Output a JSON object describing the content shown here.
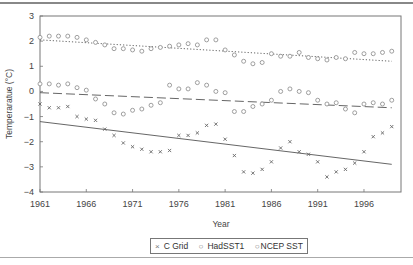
{
  "chart_data": {
    "type": "scatter",
    "title": "",
    "xlabel": "Year",
    "ylabel": "Temperaratue (°C)",
    "xlim": [
      1961,
      2000
    ],
    "ylim": [
      -4,
      3
    ],
    "x_ticks": [
      "1961",
      "1966",
      "1971",
      "1976",
      "1981",
      "1986",
      "1991",
      "1996"
    ],
    "y_ticks": [
      "3",
      "2",
      "1",
      "0",
      "−1",
      "−2",
      "−3",
      "−4"
    ],
    "grid": false,
    "legend_position": "bottom",
    "x": [
      1961,
      1962,
      1963,
      1964,
      1965,
      1966,
      1967,
      1968,
      1969,
      1970,
      1971,
      1972,
      1973,
      1974,
      1975,
      1976,
      1977,
      1978,
      1979,
      1980,
      1981,
      1982,
      1983,
      1984,
      1985,
      1986,
      1987,
      1988,
      1989,
      1990,
      1991,
      1992,
      1993,
      1994,
      1995,
      1996,
      1997,
      1998,
      1999
    ],
    "series": [
      {
        "name": "C Grid",
        "marker": "x",
        "values": [
          -0.5,
          -0.65,
          -0.65,
          -0.6,
          -1.0,
          -1.1,
          -1.15,
          -1.5,
          -1.75,
          -2.05,
          -2.2,
          -2.3,
          -2.4,
          -2.4,
          -2.35,
          -1.75,
          -1.75,
          -1.65,
          -1.35,
          -1.3,
          -1.9,
          -2.55,
          -3.2,
          -3.25,
          -3.1,
          -2.8,
          -2.25,
          -2.0,
          -2.4,
          -2.5,
          -2.8,
          -3.4,
          -3.2,
          -3.1,
          -2.85,
          -2.4,
          -1.8,
          -1.65,
          -1.4
        ],
        "trend": {
          "style": "solid",
          "start": -1.2,
          "end": -2.9
        }
      },
      {
        "name": "HadSST1",
        "marker": "o",
        "values": [
          0.3,
          0.3,
          0.25,
          0.3,
          0.15,
          0.05,
          -0.3,
          -0.5,
          -0.85,
          -0.9,
          -0.75,
          -0.7,
          -0.55,
          -0.45,
          0.25,
          0.1,
          0.1,
          0.35,
          0.25,
          0.0,
          -0.05,
          -0.8,
          -0.8,
          -0.6,
          -0.5,
          -0.35,
          0.0,
          0.1,
          0.0,
          -0.05,
          -0.35,
          -0.5,
          -0.45,
          -0.7,
          -0.85,
          -0.5,
          -0.45,
          -0.5,
          -0.35
        ],
        "trend": {
          "style": "dashed",
          "start": -0.05,
          "end": -0.65
        }
      },
      {
        "name": "NCEP SST",
        "marker": "o",
        "values": [
          2.15,
          2.2,
          2.2,
          2.2,
          2.15,
          2.05,
          1.95,
          1.85,
          1.7,
          1.7,
          1.65,
          1.6,
          1.7,
          1.75,
          1.8,
          1.85,
          1.9,
          1.85,
          2.05,
          2.05,
          1.65,
          1.45,
          1.2,
          1.1,
          1.15,
          1.5,
          1.4,
          1.4,
          1.55,
          1.35,
          1.3,
          1.25,
          1.35,
          1.3,
          1.55,
          1.5,
          1.5,
          1.55,
          1.6
        ],
        "trend": {
          "style": "dotted",
          "start": 2.05,
          "end": 1.2
        }
      }
    ]
  },
  "legend": {
    "items": [
      {
        "marker": "×",
        "label": "C Grid"
      },
      {
        "marker": "○",
        "label": "HadSST1"
      },
      {
        "marker": "○",
        "label": "NCEP SST"
      }
    ]
  },
  "axes": {
    "xlabel": "Year",
    "ylabel": "Temperaratue (°C)"
  }
}
